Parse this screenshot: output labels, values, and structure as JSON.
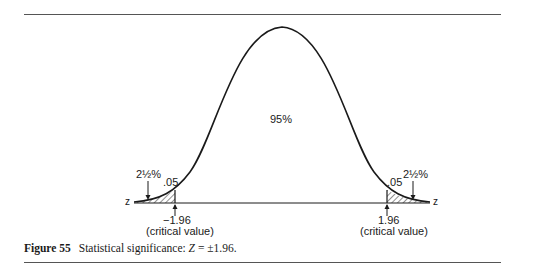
{
  "figure": {
    "caption_label": "Figure 55",
    "caption_text_before": "Statistical significance: ",
    "caption_var": "Z",
    "caption_text_after": " = ±1.96.",
    "center_label": "95%",
    "left_tail_percent": "2½%",
    "right_tail_percent": "2½%",
    "left_alpha": ".05",
    "right_alpha": ".05",
    "left_critical": "−1.96",
    "right_critical": "1.96",
    "critical_label": "(critical value)",
    "axis_label_left": "z",
    "axis_label_right": "z",
    "colors": {
      "line": "#1a1a1a",
      "rule": "#555555"
    }
  }
}
